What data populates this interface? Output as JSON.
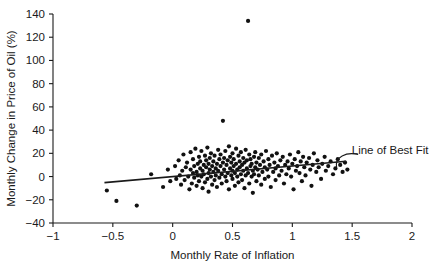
{
  "chart_data": {
    "type": "scatter",
    "title": "",
    "xlabel": "Monthly Rate of Inflation",
    "ylabel": "Monthly Change in Price of Oil (%)",
    "xlim": [
      -1,
      2
    ],
    "ylim": [
      -40,
      140
    ],
    "xticks": [
      -1,
      -0.5,
      0,
      0.5,
      1,
      1.5,
      2
    ],
    "xticklabels": [
      "−1",
      "−0.5",
      "0",
      "0.5",
      "1",
      "1.5",
      "2"
    ],
    "yticks": [
      -40,
      -20,
      0,
      20,
      40,
      60,
      80,
      100,
      120,
      140
    ],
    "yticklabels": [
      "−40",
      "−20",
      "0",
      "20",
      "40",
      "60",
      "80",
      "100",
      "120",
      "140"
    ],
    "grid": false,
    "legend": null,
    "marker": "filled-circle",
    "marker_color": "#111111",
    "marker_size": 2.1,
    "n_points": 201,
    "annotations": [
      {
        "text": "Line of Best Fit",
        "text_x": 1.48,
        "text_y": 23,
        "leader_from_x": 1.37,
        "leader_from_y": 8,
        "leader_to_x": 1.55,
        "leader_to_y": 19
      }
    ],
    "fit_line": {
      "label": "Line of Best Fit",
      "x_start": -0.57,
      "y_start": -5.2,
      "x_end": 1.45,
      "y_end": 13.2,
      "slope": 9.1,
      "intercept": 0.0
    },
    "points": [
      [
        -0.55,
        -12
      ],
      [
        -0.47,
        -21
      ],
      [
        -0.3,
        -25
      ],
      [
        -0.18,
        2
      ],
      [
        -0.08,
        -9
      ],
      [
        -0.04,
        6
      ],
      [
        -0.02,
        -4
      ],
      [
        0.02,
        9
      ],
      [
        0.03,
        -2
      ],
      [
        0.05,
        14
      ],
      [
        0.06,
        1
      ],
      [
        0.07,
        -7
      ],
      [
        0.08,
        5
      ],
      [
        0.09,
        19
      ],
      [
        0.1,
        -3
      ],
      [
        0.11,
        8
      ],
      [
        0.12,
        12
      ],
      [
        0.13,
        0
      ],
      [
        0.14,
        -11
      ],
      [
        0.15,
        6
      ],
      [
        0.15,
        21
      ],
      [
        0.16,
        -6
      ],
      [
        0.17,
        3
      ],
      [
        0.17,
        15
      ],
      [
        0.18,
        9
      ],
      [
        0.18,
        -1
      ],
      [
        0.19,
        24
      ],
      [
        0.2,
        4
      ],
      [
        0.2,
        -8
      ],
      [
        0.21,
        11
      ],
      [
        0.21,
        1
      ],
      [
        0.22,
        17
      ],
      [
        0.22,
        -4
      ],
      [
        0.23,
        7
      ],
      [
        0.23,
        13
      ],
      [
        0.24,
        0
      ],
      [
        0.24,
        22
      ],
      [
        0.25,
        -10
      ],
      [
        0.25,
        5
      ],
      [
        0.26,
        10
      ],
      [
        0.26,
        2
      ],
      [
        0.27,
        18
      ],
      [
        0.27,
        -5
      ],
      [
        0.28,
        8
      ],
      [
        0.28,
        14
      ],
      [
        0.29,
        -2
      ],
      [
        0.29,
        25
      ],
      [
        0.3,
        3
      ],
      [
        0.3,
        11
      ],
      [
        0.3,
        -13
      ],
      [
        0.31,
        6
      ],
      [
        0.31,
        16
      ],
      [
        0.32,
        0
      ],
      [
        0.32,
        20
      ],
      [
        0.33,
        -7
      ],
      [
        0.33,
        9
      ],
      [
        0.34,
        4
      ],
      [
        0.34,
        13
      ],
      [
        0.35,
        -3
      ],
      [
        0.35,
        18
      ],
      [
        0.36,
        7
      ],
      [
        0.36,
        1
      ],
      [
        0.37,
        11
      ],
      [
        0.37,
        -9
      ],
      [
        0.38,
        23
      ],
      [
        0.38,
        5
      ],
      [
        0.39,
        15
      ],
      [
        0.39,
        -1
      ],
      [
        0.4,
        9
      ],
      [
        0.4,
        19
      ],
      [
        0.41,
        2
      ],
      [
        0.41,
        -6
      ],
      [
        0.42,
        12
      ],
      [
        0.42,
        48
      ],
      [
        0.43,
        6
      ],
      [
        0.43,
        16
      ],
      [
        0.44,
        0
      ],
      [
        0.44,
        22
      ],
      [
        0.45,
        -4
      ],
      [
        0.45,
        10
      ],
      [
        0.46,
        14
      ],
      [
        0.46,
        3
      ],
      [
        0.47,
        26
      ],
      [
        0.47,
        -11
      ],
      [
        0.48,
        7
      ],
      [
        0.48,
        17
      ],
      [
        0.49,
        1
      ],
      [
        0.49,
        12
      ],
      [
        0.5,
        -2
      ],
      [
        0.5,
        20
      ],
      [
        0.5,
        5
      ],
      [
        0.51,
        9
      ],
      [
        0.51,
        15
      ],
      [
        0.52,
        -8
      ],
      [
        0.52,
        3
      ],
      [
        0.53,
        24
      ],
      [
        0.53,
        11
      ],
      [
        0.54,
        6
      ],
      [
        0.54,
        0
      ],
      [
        0.55,
        18
      ],
      [
        0.55,
        -5
      ],
      [
        0.56,
        13
      ],
      [
        0.56,
        8
      ],
      [
        0.57,
        2
      ],
      [
        0.57,
        21
      ],
      [
        0.58,
        -3
      ],
      [
        0.58,
        10
      ],
      [
        0.59,
        16
      ],
      [
        0.59,
        5
      ],
      [
        0.6,
        -10
      ],
      [
        0.6,
        12
      ],
      [
        0.61,
        1
      ],
      [
        0.61,
        23
      ],
      [
        0.62,
        7
      ],
      [
        0.62,
        14
      ],
      [
        0.63,
        134
      ],
      [
        0.63,
        3
      ],
      [
        0.64,
        19
      ],
      [
        0.64,
        -6
      ],
      [
        0.65,
        9
      ],
      [
        0.65,
        15
      ],
      [
        0.66,
        0
      ],
      [
        0.66,
        11
      ],
      [
        0.67,
        5
      ],
      [
        0.67,
        -14
      ],
      [
        0.68,
        17
      ],
      [
        0.68,
        2
      ],
      [
        0.69,
        21
      ],
      [
        0.69,
        8
      ],
      [
        0.7,
        12
      ],
      [
        0.7,
        -4
      ],
      [
        0.71,
        6
      ],
      [
        0.72,
        16
      ],
      [
        0.72,
        1
      ],
      [
        0.73,
        10
      ],
      [
        0.74,
        -7
      ],
      [
        0.74,
        19
      ],
      [
        0.75,
        4
      ],
      [
        0.76,
        13
      ],
      [
        0.77,
        8
      ],
      [
        0.77,
        -2
      ],
      [
        0.78,
        22
      ],
      [
        0.79,
        6
      ],
      [
        0.8,
        15
      ],
      [
        0.8,
        0
      ],
      [
        0.81,
        10
      ],
      [
        0.82,
        -9
      ],
      [
        0.83,
        18
      ],
      [
        0.84,
        4
      ],
      [
        0.85,
        12
      ],
      [
        0.86,
        7
      ],
      [
        0.86,
        -3
      ],
      [
        0.87,
        20
      ],
      [
        0.88,
        9
      ],
      [
        0.89,
        1
      ],
      [
        0.9,
        14
      ],
      [
        0.91,
        5
      ],
      [
        0.92,
        17
      ],
      [
        0.93,
        -6
      ],
      [
        0.94,
        10
      ],
      [
        0.95,
        2
      ],
      [
        0.96,
        13
      ],
      [
        0.97,
        7
      ],
      [
        0.98,
        19
      ],
      [
        0.99,
        0
      ],
      [
        1.0,
        11
      ],
      [
        1.01,
        -11
      ],
      [
        1.02,
        15
      ],
      [
        1.03,
        5
      ],
      [
        1.04,
        9
      ],
      [
        1.05,
        21
      ],
      [
        1.06,
        3
      ],
      [
        1.07,
        13
      ],
      [
        1.08,
        -4
      ],
      [
        1.09,
        17
      ],
      [
        1.1,
        8
      ],
      [
        1.11,
        1
      ],
      [
        1.12,
        12
      ],
      [
        1.14,
        16
      ],
      [
        1.15,
        6
      ],
      [
        1.16,
        -8
      ],
      [
        1.17,
        10
      ],
      [
        1.18,
        20
      ],
      [
        1.2,
        4
      ],
      [
        1.21,
        14
      ],
      [
        1.22,
        8
      ],
      [
        1.24,
        -2
      ],
      [
        1.25,
        11
      ],
      [
        1.27,
        17
      ],
      [
        1.28,
        5
      ],
      [
        1.3,
        9
      ],
      [
        1.32,
        13
      ],
      [
        1.34,
        2
      ],
      [
        1.36,
        7
      ],
      [
        1.38,
        15
      ],
      [
        1.4,
        10
      ],
      [
        1.42,
        4
      ],
      [
        1.44,
        12
      ],
      [
        1.46,
        6
      ]
    ]
  }
}
